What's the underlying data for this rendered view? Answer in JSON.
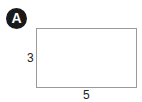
{
  "figure": {
    "badge": "A",
    "shape": "rectangle",
    "height_label": "3",
    "width_label": "5"
  },
  "colors": {
    "badge_bg": "#1a1a1a",
    "badge_text": "#ffffff",
    "outline": "#9a9a9a"
  }
}
